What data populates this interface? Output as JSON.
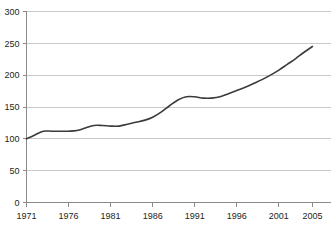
{
  "chart_data": {
    "type": "line",
    "title": "",
    "subtitle": "",
    "xlabel": "",
    "ylabel": "",
    "xlim": [
      1971,
      2005
    ],
    "ylim": [
      0,
      300
    ],
    "grid": "horizontal",
    "legend": "none",
    "y_ticks": [
      0,
      50,
      100,
      150,
      200,
      250,
      300
    ],
    "y_tick_labels": [
      "0",
      "50",
      "100",
      "150",
      "200",
      "250",
      "300"
    ],
    "x_ticks": [
      1971,
      1976,
      1981,
      1986,
      1991,
      1996,
      2001,
      2005
    ],
    "x_tick_labels": [
      "1971",
      "1976",
      "1981",
      "1986",
      "1991",
      "1996",
      "2001",
      "2005"
    ],
    "series": [
      {
        "name": "index",
        "color": "#3b3b3b",
        "x": [
          1971,
          1972,
          1973,
          1974,
          1975,
          1976,
          1977,
          1978,
          1979,
          1980,
          1981,
          1982,
          1983,
          1984,
          1985,
          1986,
          1987,
          1988,
          1989,
          1990,
          1991,
          1992,
          1993,
          1994,
          1995,
          1996,
          1997,
          1998,
          1999,
          2000,
          2001,
          2002,
          2003,
          2004,
          2005
        ],
        "values": [
          100,
          106,
          112,
          112,
          112,
          112,
          113,
          117,
          121,
          121,
          120,
          120,
          123,
          126,
          129,
          134,
          142,
          152,
          161,
          166,
          166,
          164,
          164,
          166,
          171,
          176,
          181,
          187,
          193,
          200,
          208,
          217,
          226,
          236,
          245
        ]
      }
    ]
  },
  "colors": {
    "line": "#3b3b3b",
    "grid": "#c9c9c9",
    "axis": "#8a8a8a",
    "tick": "#8a8a8a",
    "text": "#231f20",
    "background": "#ffffff"
  }
}
